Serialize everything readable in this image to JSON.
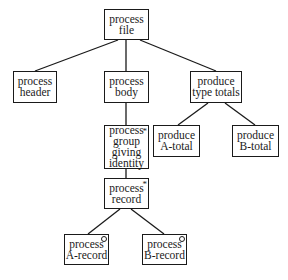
{
  "diagram": {
    "type": "jackson-structure-tree",
    "nodes": [
      {
        "id": "process-file",
        "label": "process\nfile",
        "marker": "",
        "x": 104,
        "y": 9,
        "w": 45,
        "h": 31
      },
      {
        "id": "process-header",
        "label": "process\nheader",
        "marker": "",
        "x": 13,
        "y": 71,
        "w": 44,
        "h": 32
      },
      {
        "id": "process-body",
        "label": "process\nbody",
        "marker": "",
        "x": 104,
        "y": 71,
        "w": 45,
        "h": 32
      },
      {
        "id": "produce-type-totals",
        "label": "produce\ntype totals",
        "marker": "",
        "x": 190,
        "y": 71,
        "w": 52,
        "h": 32
      },
      {
        "id": "process-group-giving-identity",
        "label": "process\ngroup\ngiving\nidentity",
        "marker": "*",
        "x": 104,
        "y": 125,
        "w": 45,
        "h": 44
      },
      {
        "id": "produce-a-total",
        "label": "produce\nA-total",
        "marker": "",
        "x": 153,
        "y": 125,
        "w": 47,
        "h": 32
      },
      {
        "id": "produce-b-total",
        "label": "produce\nB-total",
        "marker": "",
        "x": 232,
        "y": 125,
        "w": 47,
        "h": 32
      },
      {
        "id": "process-record",
        "label": "process\nrecord",
        "marker": "*",
        "x": 104,
        "y": 178,
        "w": 45,
        "h": 31
      },
      {
        "id": "process-a-record",
        "label": "process\nA-record",
        "marker": "o",
        "x": 64,
        "y": 234,
        "w": 45,
        "h": 31
      },
      {
        "id": "process-b-record",
        "label": "process\nB-record",
        "marker": "o",
        "x": 142,
        "y": 234,
        "w": 45,
        "h": 31
      }
    ],
    "edges": [
      {
        "from": "process-file",
        "to": "process-header",
        "x1": 118,
        "y1": 40,
        "x2": 35,
        "y2": 71
      },
      {
        "from": "process-file",
        "to": "process-body",
        "x1": 126,
        "y1": 40,
        "x2": 126,
        "y2": 71
      },
      {
        "from": "process-file",
        "to": "produce-type-totals",
        "x1": 140,
        "y1": 40,
        "x2": 216,
        "y2": 71
      },
      {
        "from": "process-body",
        "to": "process-group-giving-identity",
        "x1": 126,
        "y1": 103,
        "x2": 126,
        "y2": 125
      },
      {
        "from": "produce-type-totals",
        "to": "produce-a-total",
        "x1": 208,
        "y1": 103,
        "x2": 178,
        "y2": 125
      },
      {
        "from": "produce-type-totals",
        "to": "produce-b-total",
        "x1": 225,
        "y1": 103,
        "x2": 255,
        "y2": 125
      },
      {
        "from": "process-group-giving-identity",
        "to": "process-record",
        "x1": 126,
        "y1": 169,
        "x2": 126,
        "y2": 178
      },
      {
        "from": "process-record",
        "to": "process-a-record",
        "x1": 120,
        "y1": 209,
        "x2": 88,
        "y2": 234
      },
      {
        "from": "process-record",
        "to": "process-b-record",
        "x1": 131,
        "y1": 209,
        "x2": 164,
        "y2": 234
      }
    ]
  },
  "nodes_text": {
    "process_file": "process\nfile",
    "process_header": "process\nheader",
    "process_body": "process\nbody",
    "produce_type_totals": "produce\ntype totals",
    "process_group": "process\ngroup\ngiving\nidentity",
    "produce_a_total": "produce\nA-total",
    "produce_b_total": "produce\nB-total",
    "process_record": "process\nrecord",
    "process_a_record": "process\nA-record",
    "process_b_record": "process\nB-record"
  },
  "markers": {
    "iteration": "*",
    "selection": "o"
  }
}
